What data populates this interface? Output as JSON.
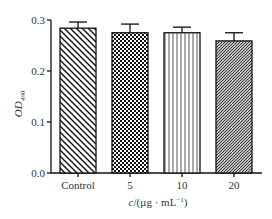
{
  "chart_data": {
    "type": "bar",
    "title": "",
    "xlabel": "c/(µg · mL⁻¹)",
    "ylabel": "OD",
    "ylabel_subscript": "490",
    "categories": [
      "Control",
      "5",
      "10",
      "20"
    ],
    "values": [
      0.284,
      0.275,
      0.275,
      0.259
    ],
    "error_upper": [
      0.012,
      0.017,
      0.011,
      0.016
    ],
    "ylim": [
      0.0,
      0.3
    ],
    "yticks": [
      "0.0",
      "0.1",
      "0.2",
      "0.3"
    ],
    "grid": false,
    "legend": null,
    "bar_patterns": [
      "diagonal-backslash",
      "checkerboard",
      "vertical-lines",
      "dense-diagonal-slash"
    ]
  },
  "axis": {
    "x_title_prefix": "c",
    "x_title_unit": "/(µg · mL",
    "x_title_sup": "−1",
    "x_title_close": ")",
    "y_title_main": "OD",
    "y_title_sub": "490"
  }
}
